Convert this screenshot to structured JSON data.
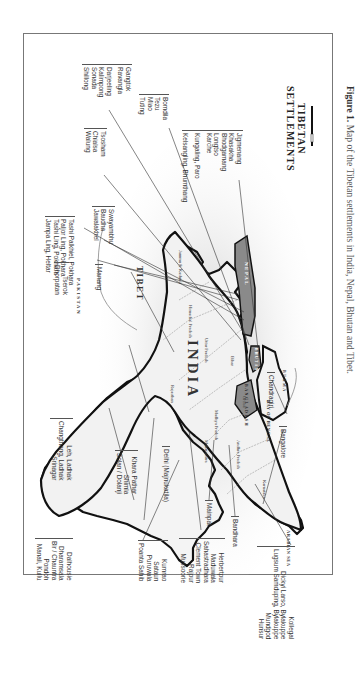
{
  "caption": {
    "prefix": "Figure 1.",
    "text": "Map of the Tibetan settlements in India, Nepal, Bhutan and Tibet."
  },
  "map_title": [
    "TIBETAN",
    "SETTLEMENTS"
  ],
  "countries": {
    "india": "INDIA",
    "tibet": "TIBET",
    "nepal": "NEPAL",
    "pakistan": "PAKISTAN",
    "bangladesh": "BANGLADESH",
    "bhutan": "BHUTAN",
    "burma": "BURMA"
  },
  "water_bodies": {
    "bay_of_bengal": "BAY OF BENGAL",
    "arabian_sea": "ARABIAN SEA"
  },
  "states": [
    "Jammu & Kashmir",
    "Himachal Pradesh",
    "Uttar Pradesh",
    "Bihar",
    "Madhya Pradesh",
    "Rajasthan",
    "Orissa",
    "Maharashtra",
    "Andhra Pradesh",
    "Karnataka",
    "Punjab",
    "Bengal"
  ],
  "settlement_groups": {
    "gangtok": [
      "Gangtok",
      "Ravangla",
      "",
      "Darjeeling",
      "Kalimpong",
      "Sonada",
      "Shillong"
    ],
    "tsosham": [
      "Tsosham",
      "Chialsa",
      "Walung"
    ],
    "bomdila": [
      "Bomdila",
      "Tezu",
      "Miao",
      "Tuting"
    ],
    "bhutan": [
      "Jigmenang",
      "Khasakha",
      "Bhodgamang",
      "Longtso",
      "Karche",
      "",
      "Kungaling, Paro",
      "",
      "Kelsangling, Bhumthang"
    ],
    "pokhara": [
      "Tashi Palkhiel, Pokhara",
      "Paljor Ling, Pokhara",
      "Tashi Ling, Pokhara",
      "Jampa Ling, Heltar"
    ],
    "swayambhu": [
      "Swayambhu",
      "Baudha",
      "Jawalakhel"
    ],
    "manang": [
      "Manang"
    ],
    "tserok": [
      "Tserok",
      "Dhorpatan"
    ],
    "ladakh": [
      "Leh, Ladhak",
      "Changthang, Ladhak",
      "Srinagar"
    ],
    "himachal": [
      "Dalhousie",
      "Dharamsala",
      "Bir / Chauntra",
      "Pondoh",
      "Manali, Kullu"
    ],
    "shimla": [
      "Khara Pathar",
      "Shimla",
      "Solan / Dolanji"
    ],
    "delhi": [
      "Delhi (Majnukatila)"
    ],
    "kumrao": [
      "Kumrao",
      "Sataun",
      "Puruwala",
      "Poanta Sahib"
    ],
    "dehradun": [
      "Herbertpur",
      "Maduwala",
      "Sahastradhara",
      "Clement Town",
      "Rajpur",
      "Mussoorie"
    ],
    "mainpat": [
      "Mainpat"
    ],
    "bandhara": [
      "Bandhara"
    ],
    "chandragiri": [
      "Chandragiri"
    ],
    "bangalore": [
      "Bangalore"
    ],
    "karnataka": [
      "Kollegal",
      "Dickyi Larso, Bylakuppe",
      "Lugsum Samduping, Bylakuppe",
      "Mundgod",
      "Hunsur"
    ]
  }
}
